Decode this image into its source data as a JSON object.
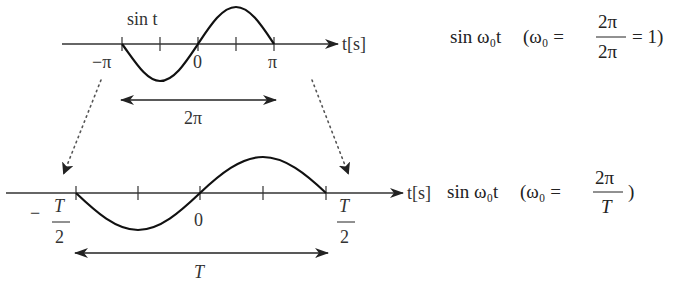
{
  "diagram": {
    "top": {
      "curve_label": "sin t",
      "axis_label": "t[s]",
      "ticks": [
        {
          "label": "−π"
        },
        {
          "label": ""
        },
        {
          "label": "0"
        },
        {
          "label": ""
        },
        {
          "label": "π"
        }
      ],
      "span_label": "2π",
      "formula": {
        "lhs": "sin ω₀t",
        "open": "(ω₀ =",
        "num": "2π",
        "den": "2π",
        "tail": "= 1)"
      }
    },
    "bottom": {
      "axis_label": "t[s]",
      "ticks": [
        {
          "label_num": "T",
          "label_den": "2",
          "sign": "−"
        },
        {
          "label": ""
        },
        {
          "label": "0"
        },
        {
          "label": ""
        },
        {
          "label_num": "T",
          "label_den": "2",
          "sign": ""
        }
      ],
      "span_label": "T",
      "formula": {
        "lhs": "sin ω₀t",
        "open": "(ω₀ =",
        "num": "2π",
        "den": "T",
        "tail": ")"
      }
    },
    "colors": {
      "ink": "#222222",
      "axis": "#333333",
      "dots": "#555555"
    }
  }
}
